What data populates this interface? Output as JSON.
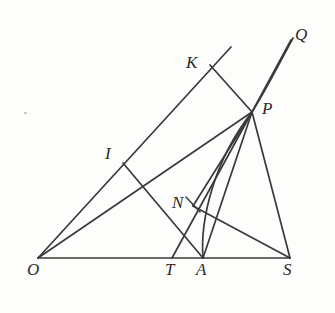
{
  "figure": {
    "name": "geometry-construction-diagram",
    "background_color": "#fdfdfb",
    "stroke_color": "#3a3a3a",
    "label_color": "#2b2b2b",
    "width": 335,
    "height": 313
  },
  "labels": [
    {
      "id": "O",
      "text": "O",
      "x": 27,
      "y": 261
    },
    {
      "id": "T",
      "text": "T",
      "x": 165,
      "y": 261
    },
    {
      "id": "A",
      "text": "A",
      "x": 196,
      "y": 261
    },
    {
      "id": "S",
      "text": "S",
      "x": 283,
      "y": 261
    },
    {
      "id": "N",
      "text": "N",
      "x": 172,
      "y": 194
    },
    {
      "id": "I",
      "text": "I",
      "x": 105,
      "y": 145
    },
    {
      "id": "K",
      "text": "K",
      "x": 186,
      "y": 54
    },
    {
      "id": "P",
      "text": "P",
      "x": 262,
      "y": 100
    },
    {
      "id": "Q",
      "text": "Q",
      "x": 295,
      "y": 26
    }
  ],
  "points": {
    "O": {
      "x": 38,
      "y": 258
    },
    "T": {
      "x": 172,
      "y": 258
    },
    "A": {
      "x": 203,
      "y": 258
    },
    "S": {
      "x": 290,
      "y": 258
    },
    "N": {
      "x": 196,
      "y": 209
    },
    "I": {
      "x": 123,
      "y": 163
    },
    "K": {
      "x": 210,
      "y": 65
    },
    "P": {
      "x": 252,
      "y": 112
    },
    "Q": {
      "x": 291,
      "y": 40
    },
    "ray_end": {
      "x": 231,
      "y": 47
    }
  },
  "segments": [
    {
      "id": "base-O-S",
      "from": "O",
      "to": "S"
    },
    {
      "id": "ray-O-K-end",
      "from": "O",
      "to": "ray_end"
    },
    {
      "id": "line-O-P",
      "from": "O",
      "to": "P"
    },
    {
      "id": "line-T-P",
      "from": "T",
      "to": "P"
    },
    {
      "id": "line-I-A",
      "from": "I",
      "to": "A"
    },
    {
      "id": "line-S-N",
      "from": "S",
      "to": "N"
    },
    {
      "id": "line-N-P",
      "from": "N",
      "to": "P"
    },
    {
      "id": "line-A-P",
      "from": "A",
      "to": "P"
    },
    {
      "id": "line-K-P",
      "from": "K",
      "to": "P"
    },
    {
      "id": "line-S-P",
      "from": "S",
      "to": "P"
    },
    {
      "id": "line-P-Q",
      "from": "P",
      "to": "Q"
    }
  ],
  "arcs": [
    {
      "id": "arc-A-to-P",
      "description": "arc from A curving up to P"
    },
    {
      "id": "arc-P-to-Q",
      "description": "arc from P continuing to Q"
    }
  ],
  "marks": [
    {
      "id": "right-angle-tick-at-N",
      "description": "short perpendicular tick at N foot"
    }
  ],
  "artifacts": [
    {
      "id": "scan-speck",
      "x": 24,
      "y": 112
    }
  ]
}
